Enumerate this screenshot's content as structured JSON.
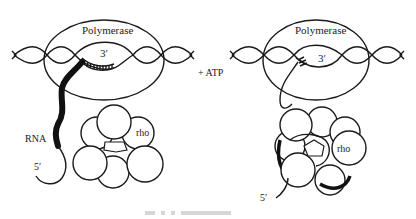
{
  "diagram": {
    "left_panel": {
      "polymerase_label": "Polymerase",
      "three_prime_label": "3′",
      "rna_label": "RNA",
      "five_prime_label": "5′",
      "rho_label": "rho"
    },
    "arrow_label": "+ ATP",
    "right_panel": {
      "polymerase_label": "Polymerase",
      "three_prime_label": "3′",
      "five_prime_label": "5′",
      "rho_label": "rho"
    }
  },
  "colors": {
    "line": "#1a1a1a",
    "background": "#ffffff"
  }
}
